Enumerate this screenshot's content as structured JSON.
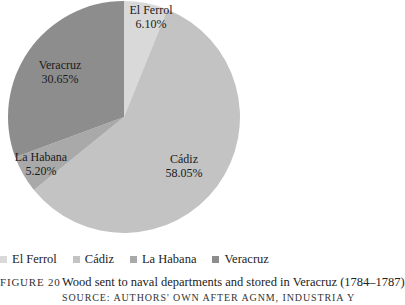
{
  "chart_data": {
    "type": "pie",
    "title": "Wood sent to naval departments and stored in Veracruz (1784–1787)",
    "categories": [
      "El Ferrol",
      "Cádiz",
      "La Habana",
      "Veracruz"
    ],
    "values": [
      6.1,
      58.05,
      5.2,
      30.65
    ],
    "value_labels": [
      "6.10%",
      "58.05%",
      "5.20%",
      "30.65%"
    ],
    "colors": [
      "#d9d9d9",
      "#c3c3c3",
      "#a9a9a9",
      "#8d8d8d"
    ],
    "start_angle": "12 o'clock, clockwise",
    "legend_position": "bottom"
  },
  "slices": [
    {
      "name": "El Ferrol",
      "pct": "6.10%"
    },
    {
      "name": "Cádiz",
      "pct": "58.05%"
    },
    {
      "name": "La Habana",
      "pct": "5.20%"
    },
    {
      "name": "Veracruz",
      "pct": "30.65%"
    }
  ],
  "legend": [
    {
      "label": "El Ferrol"
    },
    {
      "label": "Cádiz"
    },
    {
      "label": "La Habana"
    },
    {
      "label": "Veracruz"
    }
  ],
  "caption": {
    "figure_label": "Figure 20",
    "title": "Wood sent to naval departments and stored in Veracruz (1784–1787)",
    "source": "Source: Authors' own after AGNM, Industria y"
  }
}
